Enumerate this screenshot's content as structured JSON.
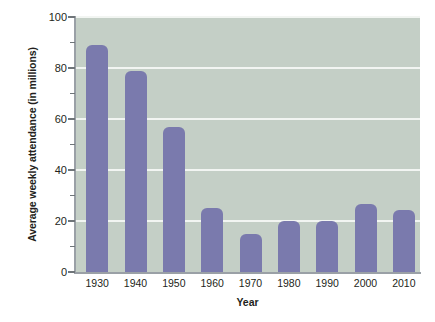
{
  "chart_data": {
    "type": "bar",
    "title": "",
    "xlabel": "Year",
    "ylabel": "Average weekly attendance (in millions)",
    "categories": [
      "1930",
      "1940",
      "1950",
      "1960",
      "1970",
      "1980",
      "1990",
      "2000",
      "2010"
    ],
    "values": [
      89,
      79,
      57,
      25,
      15,
      20,
      20,
      26.5,
      24.5
    ],
    "ylim": [
      0,
      100
    ],
    "y_ticks": [
      "100",
      "80",
      "60",
      "40",
      "20",
      "0"
    ],
    "y_tick_values": [
      100,
      80,
      60,
      40,
      20,
      0
    ],
    "y_minor_tick_values": [
      90,
      70,
      50,
      30,
      10
    ],
    "gridlines": [
      100,
      80,
      60,
      40,
      20
    ],
    "grid": true,
    "legend": "none",
    "colors": {
      "bar": "#7a7aad",
      "plot_background": "#c4cfc6",
      "gridline": "#f2f5f2",
      "axis": "#9aa0a6",
      "text": "#231f20",
      "page_background": "#ffffff"
    }
  }
}
